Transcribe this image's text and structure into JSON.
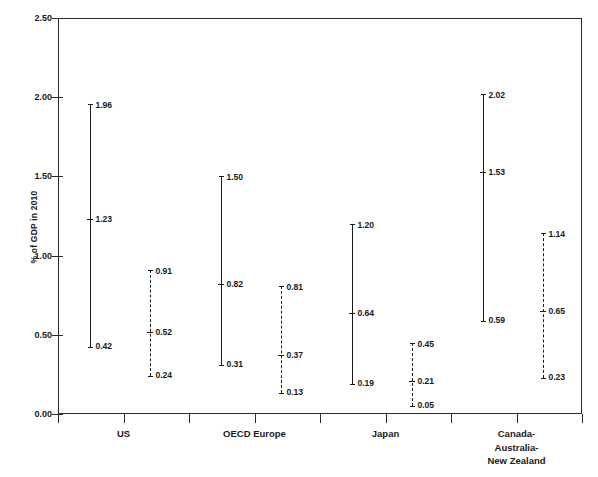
{
  "chart_data": {
    "type": "bar",
    "subtype": "range-with-midpoint",
    "title": "",
    "xlabel": "",
    "ylabel": "% of GDP in 2010",
    "ylim": [
      0.0,
      2.5
    ],
    "ytick_labels": [
      "0.00",
      "0.50",
      "1.00",
      "1.50",
      "2.00",
      "2.50"
    ],
    "ytick_values": [
      0.0,
      0.5,
      1.0,
      1.5,
      2.0,
      2.5
    ],
    "grid": false,
    "legend": "none",
    "categories": [
      "US",
      "OECD Europe",
      "Japan",
      "Canada-Australia-New Zealand"
    ],
    "category_label_lines": [
      [
        "US"
      ],
      [
        "OECD Europe"
      ],
      [
        "Japan"
      ],
      [
        "Canada-",
        "Australia-",
        "New Zealand"
      ]
    ],
    "series": [
      {
        "name": "solid-range",
        "style": "solid",
        "high": [
          1.96,
          1.5,
          1.2,
          2.02
        ],
        "mid": [
          1.23,
          0.82,
          0.64,
          1.53
        ],
        "low": [
          0.42,
          0.31,
          0.19,
          0.59
        ],
        "high_labels": [
          "1.96",
          "1.50",
          "1.20",
          "2.02"
        ],
        "mid_labels": [
          "1.23",
          "0.82",
          "0.64",
          "1.53"
        ],
        "low_labels": [
          "0.42",
          "0.31",
          "0.19",
          "0.59"
        ]
      },
      {
        "name": "dashed-range",
        "style": "dashed",
        "high": [
          0.91,
          0.81,
          0.45,
          1.14
        ],
        "mid": [
          0.52,
          0.37,
          0.21,
          0.65
        ],
        "low": [
          0.24,
          0.13,
          0.05,
          0.23
        ],
        "high_labels": [
          "0.91",
          "0.81",
          "0.45",
          "1.14"
        ],
        "mid_labels": [
          "0.52",
          "0.37",
          "0.21",
          "0.65"
        ],
        "low_labels": [
          "0.24",
          "0.13",
          "0.05",
          "0.23"
        ]
      }
    ]
  },
  "axis": {
    "y_title": "% of GDP in 2010"
  },
  "colors": {
    "ink": "#1a1a1a",
    "frame": "#2a2a2a",
    "background": "#ffffff"
  }
}
